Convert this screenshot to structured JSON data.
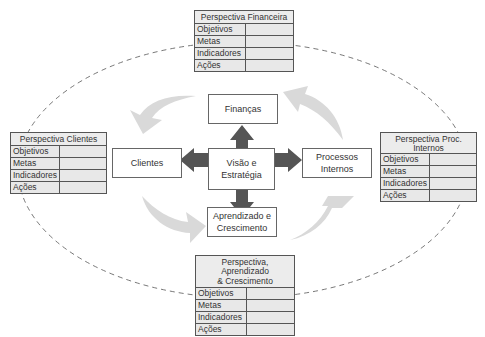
{
  "diagram": {
    "center": {
      "line1": "Visão e",
      "line2": "Estratégia"
    },
    "nodes": {
      "top": "Finanças",
      "left": "Clientes",
      "right_line1": "Processos",
      "right_line2": "Internos",
      "bottom_line1": "Aprendizado e",
      "bottom_line2": "Crescimento"
    },
    "tables": {
      "financeira": {
        "title": "Perspectiva Financeira",
        "rows": [
          "Objetivos",
          "Metas",
          "Indicadores",
          "Ações"
        ]
      },
      "clientes": {
        "title": "Perspectiva Clientes",
        "rows": [
          "Objetivos",
          "Metas",
          "Indicadores",
          "Ações"
        ]
      },
      "processos": {
        "title": "Perspectiva Proc. Internos",
        "rows": [
          "Objetivos",
          "Metas",
          "Indicadores",
          "Ações"
        ]
      },
      "aprendizado": {
        "title_line1": "Perspectiva, Aprendizado",
        "title_line2": "& Crescimento",
        "rows": [
          "Objetivos",
          "Metas",
          "Indicadores",
          "Ações"
        ]
      }
    },
    "colors": {
      "arrow_dark": "#555555",
      "arrow_light": "#d9d9d9",
      "table_bg": "#e8e8e8",
      "border": "#555555"
    }
  }
}
